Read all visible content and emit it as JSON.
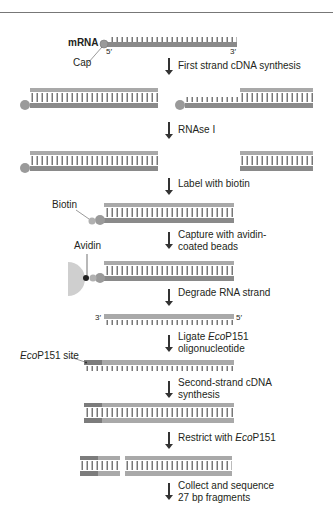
{
  "diagram": {
    "title_label": "mRNA",
    "cap_label": "Cap",
    "five_prime": "5′",
    "three_prime": "3′",
    "biotin_label": "Biotin",
    "avidin_label": "Avidin",
    "site_label_italic": "Eco",
    "site_label_rest": "P151 site",
    "steps": [
      {
        "line1": "First strand cDNA synthesis",
        "line2": ""
      },
      {
        "line1": "RNAse I",
        "line2": ""
      },
      {
        "line1": "Label with biotin",
        "line2": ""
      },
      {
        "line1": "Capture with avidin-",
        "line2": "coated beads"
      },
      {
        "line1": "Degrade RNA strand",
        "line2": ""
      },
      {
        "line1_pre": "Ligate ",
        "line1_italic": "Eco",
        "line1_post": "P151",
        "line2": "oligonucleotide"
      },
      {
        "line1": "Second-strand cDNA",
        "line2": "synthesis"
      },
      {
        "line1_pre": "Restrict with ",
        "line1_italic": "Eco",
        "line1_post": "P151",
        "line2": ""
      },
      {
        "line1": "Collect and sequence",
        "line2": "27 bp fragments"
      }
    ],
    "colors": {
      "rna": "#8a8a8a",
      "dna": "#a9a9a9",
      "cap": "#9a9a9a",
      "bead": "#cfcfcf",
      "site": "#7c7c7c"
    }
  }
}
